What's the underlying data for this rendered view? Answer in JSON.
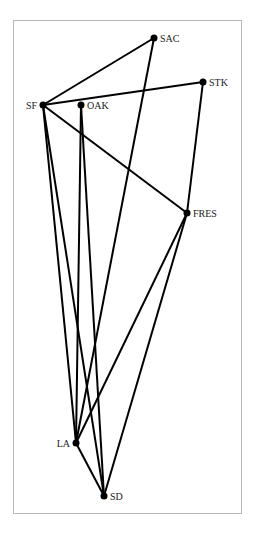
{
  "diagram": {
    "type": "graph",
    "nodes": [
      {
        "id": "SAC",
        "label": "SAC",
        "x": 154,
        "y": 38,
        "label_side": "right"
      },
      {
        "id": "STK",
        "label": "STK",
        "x": 203,
        "y": 82,
        "label_side": "right"
      },
      {
        "id": "SF",
        "label": "SF",
        "x": 43,
        "y": 105,
        "label_side": "left"
      },
      {
        "id": "OAK",
        "label": "OAK",
        "x": 81,
        "y": 105,
        "label_side": "right"
      },
      {
        "id": "FRES",
        "label": "FRES",
        "x": 187,
        "y": 213,
        "label_side": "right"
      },
      {
        "id": "LA",
        "label": "LA",
        "x": 76,
        "y": 443,
        "label_side": "left"
      },
      {
        "id": "SD",
        "label": "SD",
        "x": 104,
        "y": 496,
        "label_side": "right"
      }
    ],
    "edges": [
      [
        "SF",
        "SAC"
      ],
      [
        "SF",
        "STK"
      ],
      [
        "SF",
        "FRES"
      ],
      [
        "SF",
        "LA"
      ],
      [
        "SF",
        "SD"
      ],
      [
        "OAK",
        "LA"
      ],
      [
        "OAK",
        "SD"
      ],
      [
        "SAC",
        "LA"
      ],
      [
        "STK",
        "FRES"
      ],
      [
        "FRES",
        "LA"
      ],
      [
        "FRES",
        "SD"
      ],
      [
        "LA",
        "SD"
      ]
    ]
  }
}
